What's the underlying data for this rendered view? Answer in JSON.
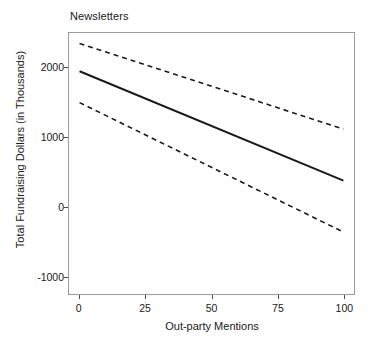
{
  "chart_data": {
    "type": "line",
    "title": "Newsletters",
    "xlabel": "Out-party Mentions",
    "ylabel": "Total Fundraising Dollars (in Thousands)",
    "xlim": [
      -4,
      104
    ],
    "ylim": [
      -1250,
      2500
    ],
    "grid": false,
    "legend": "none",
    "xticks": [
      0,
      25,
      50,
      75,
      100
    ],
    "xticklabels": [
      "0",
      "25",
      "50",
      "75",
      "100"
    ],
    "yticks": [
      2000,
      1000,
      0,
      -1000
    ],
    "yticklabels": [
      "2000",
      "1000",
      "0",
      "-1000"
    ],
    "x": [
      0,
      100
    ],
    "series": [
      {
        "name": "fit",
        "style": "solid",
        "color": "#1a1a1a",
        "width": 2,
        "values": [
          1950,
          380
        ]
      },
      {
        "name": "upper-confidence-bound",
        "style": "dashed",
        "color": "#1a1a1a",
        "width": 1.6,
        "values": [
          2350,
          1120
        ]
      },
      {
        "name": "lower-confidence-bound",
        "style": "dashed",
        "color": "#1a1a1a",
        "width": 1.6,
        "values": [
          1500,
          -360
        ]
      }
    ]
  },
  "figure": {
    "background": "#ffffff",
    "panel_border_color": "#9a9a9a",
    "text_color": "#1a1a1a"
  }
}
